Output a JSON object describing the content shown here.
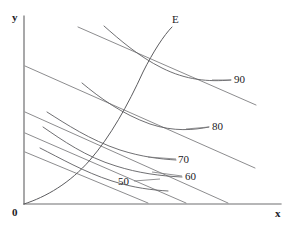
{
  "figure": {
    "background_color": "#ffffff",
    "line_color": "#6e6e70",
    "text_color": "#222225"
  },
  "axes": {
    "y_label": "y",
    "x_label": "x",
    "origin_label": "0",
    "x_axis": {
      "x1": 24,
      "y1": 204,
      "x2": 281,
      "y2": 204
    },
    "y_axis": {
      "x1": 24,
      "y1": 204,
      "x2": 24,
      "y2": 16
    }
  },
  "expansion_path": {
    "label": "E",
    "label_x": 172,
    "label_y": 14,
    "path": "M 24 204 C 46 197, 70 183, 90 160 C 110 137, 128 105, 143 72 C 153 52, 164 35, 172 27"
  },
  "chart_data": {
    "type": "line",
    "xlabel": "x",
    "ylabel": "y",
    "grid": false,
    "legend": "inline-curve-labels",
    "annotations": [
      "E",
      "0"
    ],
    "series": [
      {
        "name": "50",
        "kind": "isoquant",
        "label": "50",
        "label_x": 118,
        "label_y": 176,
        "leader": "M 134 181 L 160 179",
        "path": "M 40 148 C 60 158, 84 172, 112 181 C 134 188, 152 190, 168 191"
      },
      {
        "name": "60",
        "kind": "isoquant",
        "label": "60",
        "label_x": 185,
        "label_y": 171,
        "leader": "M 182 176 L 152 172",
        "path": "M 43 127 C 62 140, 86 157, 116 166 C 138 173, 160 176, 182 177"
      },
      {
        "name": "70",
        "kind": "isoquant",
        "label": "70",
        "label_x": 178,
        "label_y": 154,
        "leader": "M 176 159 L 148 157",
        "path": "M 47 112 C 66 124, 90 140, 120 150 C 142 157, 160 159, 176 160"
      },
      {
        "name": "80",
        "kind": "isoquant",
        "label": "80",
        "label_x": 212,
        "label_y": 121,
        "leader": "M 209 127 L 186 129",
        "path": "M 82 83 C 100 98, 122 114, 150 124 C 174 132, 194 130, 209 127"
      },
      {
        "name": "90",
        "kind": "isoquant",
        "label": "90",
        "label_x": 234,
        "label_y": 74,
        "leader": "M 231 80 L 212 80",
        "path": "M 104 26 C 120 40, 138 56, 162 68 C 186 80, 208 82, 231 80"
      }
    ],
    "isocost_lines": [
      {
        "name": "isocost-1",
        "x1": 25,
        "y1": 152,
        "x2": 148,
        "y2": 203
      },
      {
        "name": "isocost-2",
        "x1": 25,
        "y1": 133,
        "x2": 186,
        "y2": 203
      },
      {
        "name": "isocost-3",
        "x1": 25,
        "y1": 112,
        "x2": 228,
        "y2": 203
      },
      {
        "name": "isocost-4",
        "x1": 25,
        "y1": 66,
        "x2": 255,
        "y2": 168
      },
      {
        "name": "isocost-5",
        "x1": 78,
        "y1": 27,
        "x2": 256,
        "y2": 105
      }
    ]
  }
}
